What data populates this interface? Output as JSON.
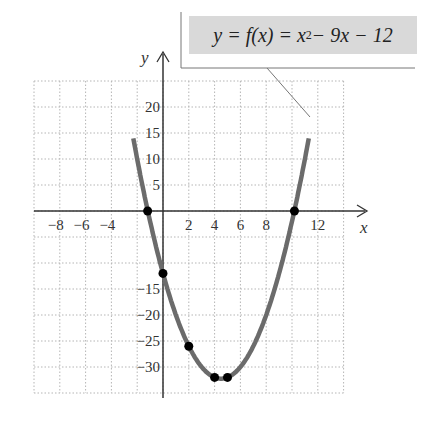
{
  "chart_data": {
    "type": "line",
    "equation": {
      "lhs": "y = f(x) = x",
      "exp": "2",
      "rest": " − 9x − 12"
    },
    "xlabel": "x",
    "ylabel": "y",
    "x_ticks": [
      "−8",
      "−6",
      "−4",
      "2",
      "4",
      "6",
      "8",
      "12"
    ],
    "x_tick_values": [
      -8,
      -6,
      -4,
      2,
      4,
      6,
      8,
      12
    ],
    "y_ticks": [
      "20",
      "15",
      "10",
      "5",
      "−15",
      "−20",
      "−25",
      "−30"
    ],
    "y_tick_values": [
      20,
      15,
      10,
      5,
      -15,
      -20,
      -25,
      -30
    ],
    "xlim": [
      -10,
      14
    ],
    "ylim": [
      -35,
      25
    ],
    "grid": true,
    "curve": {
      "function": "x^2 - 9x - 12",
      "x_range": [
        -2.3,
        11.3
      ]
    },
    "points": [
      {
        "x": -1.19,
        "y": 0
      },
      {
        "x": 0,
        "y": -12
      },
      {
        "x": 2,
        "y": -26
      },
      {
        "x": 4,
        "y": -32
      },
      {
        "x": 5,
        "y": -32
      },
      {
        "x": 10.19,
        "y": 0
      }
    ],
    "colors": {
      "curve": "#6b6b6b",
      "points": "#000000",
      "grid": "#b5b5b5",
      "axis": "#333333",
      "label_box": "#d9d9d9"
    }
  }
}
